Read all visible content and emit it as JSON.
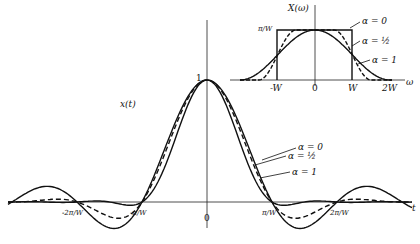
{
  "figure": {
    "main_plot": {
      "y_label": "x(t)",
      "x_label": "t",
      "peak_label": "1",
      "ticks": [
        "-2π/W",
        "-π/W",
        "0",
        "π/W",
        "2π/W"
      ],
      "legend": [
        "α = 0",
        "α = ½",
        "α = 1"
      ]
    },
    "inset_plot": {
      "y_label": "X(ω)",
      "x_label": "ω",
      "level_label": "π/W",
      "ticks": [
        "-W",
        "0",
        "W",
        "2W"
      ],
      "legend": [
        "α = 0",
        "α = ½",
        "α = 1"
      ]
    }
  },
  "chart_data": [
    {
      "type": "line",
      "title": "x(t) raised-cosine pulses",
      "xlabel": "t",
      "ylabel": "x(t)",
      "x_ticks": [
        "-2π/W",
        "-π/W",
        "0",
        "π/W",
        "2π/W"
      ],
      "series": [
        {
          "name": "α = 0",
          "style": "solid (largest sidelobes)"
        },
        {
          "name": "α = ½",
          "style": "dashed"
        },
        {
          "name": "α = 1",
          "style": "solid (smallest sidelobes)"
        }
      ],
      "peak": 1
    },
    {
      "type": "line",
      "title": "X(ω) spectrum",
      "xlabel": "ω",
      "ylabel": "X(ω)",
      "x_ticks": [
        "-W",
        "0",
        "W",
        "2W"
      ],
      "y_level": "π/W",
      "series": [
        {
          "name": "α = 0",
          "style": "rectangle from -W to W"
        },
        {
          "name": "α = ½",
          "style": "dashed rolloff"
        },
        {
          "name": "α = 1",
          "style": "solid raised cosine to ±2W"
        }
      ]
    }
  ]
}
